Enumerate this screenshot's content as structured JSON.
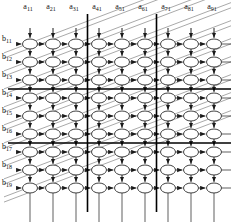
{
  "diagram": {
    "type": "systolic array dataflow grid",
    "grid": {
      "rows": 9,
      "cols": 9,
      "block_rows": 3,
      "block_cols": 3
    },
    "colors": {
      "line": "#1a1a1a",
      "thick_divider": "#000000",
      "diagonal": "#6f6f6f",
      "node_stroke": "#2b2b2b",
      "node_fill": "#ffffff",
      "background": "#ffffff"
    },
    "geometry": {
      "col_x": [
        30,
        53,
        76,
        99,
        122,
        145,
        168,
        191,
        214
      ],
      "row_y": [
        44,
        62,
        80,
        98,
        116,
        134,
        152,
        170,
        188
      ],
      "node_rx": 7.5,
      "node_ry": 5.0,
      "v_divider_x": [
        87.5,
        156.5
      ],
      "h_divider_y": [
        89.0,
        143.0
      ]
    },
    "column_inputs": {
      "name": "a-inputs",
      "labels": [
        {
          "base": "a",
          "sub": "11"
        },
        {
          "base": "a",
          "sub": "21"
        },
        {
          "base": "a",
          "sub": "31"
        },
        {
          "base": "a",
          "sub": "41"
        },
        {
          "base": "a",
          "sub": "51"
        },
        {
          "base": "a",
          "sub": "61"
        },
        {
          "base": "a",
          "sub": "71"
        },
        {
          "base": "a",
          "sub": "81"
        },
        {
          "base": "a",
          "sub": "91"
        }
      ]
    },
    "row_inputs": {
      "name": "b-inputs",
      "labels": [
        {
          "base": "b",
          "sub": "11"
        },
        {
          "base": "b",
          "sub": "12"
        },
        {
          "base": "b",
          "sub": "13"
        },
        {
          "base": "b",
          "sub": "14"
        },
        {
          "base": "b",
          "sub": "15"
        },
        {
          "base": "b",
          "sub": "16"
        },
        {
          "base": "b",
          "sub": "17"
        },
        {
          "base": "b",
          "sub": "18"
        },
        {
          "base": "b",
          "sub": "19"
        }
      ]
    }
  }
}
